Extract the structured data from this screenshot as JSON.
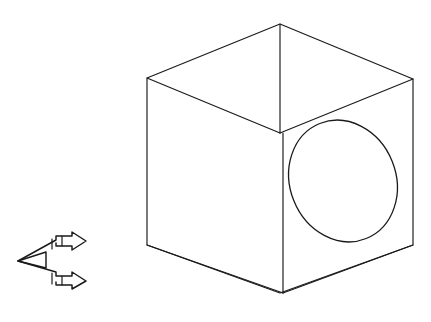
{
  "figure": {
    "background_color": "#ffffff",
    "line_color": "#1a1a1a",
    "canvas": {
      "width": 431,
      "height": 322
    }
  },
  "cube": {
    "name": "isometric-cube",
    "description": "Hexagonal outline isometric cube drawn in wireframe with three visible faces",
    "vertices": {
      "top": [
        280,
        24
      ],
      "left_upper": [
        147,
        78
      ],
      "right_upper": [
        413,
        79
      ],
      "center": [
        280,
        133
      ],
      "left_lower": [
        147,
        245
      ],
      "right_lower": [
        413,
        245
      ],
      "bottom": [
        280,
        293
      ]
    },
    "outline_path": "M 280 24 L 147 78 L 147 245 L 280 293 L 413 245 L 413 79 Z",
    "inner_edges": [
      {
        "name": "edge-center-to-top",
        "d": "M 280 133 L 280 24"
      },
      {
        "name": "edge-center-to-left",
        "d": "M 280 133 L 147 78"
      },
      {
        "name": "edge-center-to-right",
        "d": "M 280 133 L 413 79"
      },
      {
        "name": "edge-center-vertical-down",
        "d": "M 283 133 L 283 293"
      },
      {
        "name": "edge-bottom-to-left",
        "d": "M 283 293 L 147 245"
      },
      {
        "name": "edge-bottom-to-right",
        "d": "M 283 293 L 413 245"
      }
    ],
    "vertical_edge_double": {
      "name": "front-vertical-edge-pair",
      "offset_px": 3
    }
  },
  "hole": {
    "name": "circular-hole-ellipse",
    "description": "Circle on the right-hand face rendered as a tilted ellipse in isometric projection",
    "center": [
      343,
      181
    ],
    "rx": 53,
    "ry": 62,
    "rotation_deg": -22
  },
  "projection_symbol": {
    "name": "projection-direction-symbol",
    "description": "Small first-angle / direction-of-view arrow symbol at lower left",
    "bounds": {
      "x": 16,
      "y": 234,
      "width": 76,
      "height": 52
    },
    "paths": [
      {
        "name": "arrow-upper-outline",
        "d": "M 18 261 L 56 240 L 56 236 L 72 236 L 72 232 L 86 241 L 72 250 L 72 246 L 56 246 L 56 243"
      },
      {
        "name": "arrow-lower-outline",
        "d": "M 18 261 L 56 272 L 56 276 L 72 276 L 72 272 L 86 281 L 72 289 L 72 285 L 56 285 L 56 282"
      },
      {
        "name": "spine-left",
        "d": "M 18 261 L 46 252 L 46 268 Z"
      },
      {
        "name": "cross-bar-upper",
        "d": "M 52 239 L 52 249"
      },
      {
        "name": "cross-bar-lower",
        "d": "M 52 273 L 52 284"
      },
      {
        "name": "tick-upper",
        "d": "M 62 236 L 62 246"
      },
      {
        "name": "tick-lower",
        "d": "M 62 276 L 62 285"
      }
    ]
  },
  "elements": {
    "cube_label": "Cube",
    "hole_label": "Hole",
    "symbol_label": "Projection symbol"
  }
}
